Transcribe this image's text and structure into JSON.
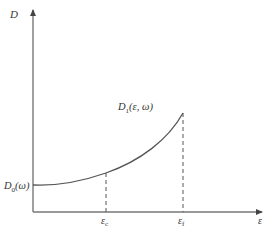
{
  "diagram": {
    "y_axis_label": "D",
    "x_axis_label": "ε",
    "curve_start_label": {
      "base": "D",
      "sub": "0",
      "arg": "(ω)"
    },
    "curve_end_label": {
      "base": "D",
      "sub": "1",
      "arg": "(ε, ω)"
    },
    "marker_c": {
      "base": "ε",
      "sub": "c"
    },
    "marker_f": {
      "base": "ε",
      "sub": "f"
    },
    "colors": {
      "line": "#555555",
      "axis": "#777777",
      "text": "#333333"
    }
  }
}
